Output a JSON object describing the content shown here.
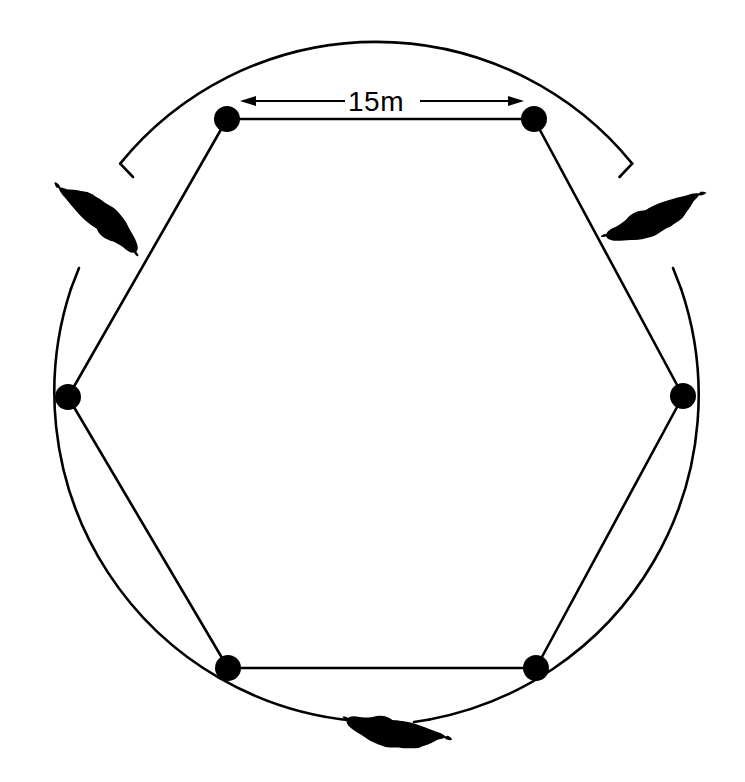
{
  "figure": {
    "background_color": "#ffffff",
    "ink_color": "#000000",
    "width": 745,
    "height": 782
  },
  "dimension": {
    "label": "15m",
    "value": 15,
    "unit": "m",
    "measures": "distance between adjacent hexagon vertices (top edge)",
    "line_y": 101,
    "left_arrow_x": 240,
    "right_arrow_x": 524,
    "label_x": 376,
    "label_y": 110
  },
  "circle": {
    "name": "outer-circle",
    "center_x": 376,
    "center_y": 393,
    "radius": 330,
    "stroke_width": 2.6,
    "stroke_color": "#000000",
    "fill": "none"
  },
  "hexagon": {
    "name": "inscribed-hexagon",
    "stroke_width": 2.6,
    "stroke_color": "#000000",
    "fill": "none",
    "vertex_count": 6,
    "side_length_label": "15m",
    "points": "227,119 534,119 683,396 536,668 228,668 68,397",
    "vertices": [
      {
        "id": "v1",
        "name": "vertex-top-left",
        "x": 227,
        "y": 119,
        "r": 13
      },
      {
        "id": "v2",
        "name": "vertex-top-right",
        "x": 534,
        "y": 119,
        "r": 13
      },
      {
        "id": "v3",
        "name": "vertex-right",
        "x": 683,
        "y": 396,
        "r": 13
      },
      {
        "id": "v4",
        "name": "vertex-bottom-right",
        "x": 536,
        "y": 668,
        "r": 13
      },
      {
        "id": "v5",
        "name": "vertex-bottom-left",
        "x": 228,
        "y": 668,
        "r": 13
      },
      {
        "id": "v6",
        "name": "vertex-left",
        "x": 68,
        "y": 397,
        "r": 13
      }
    ]
  },
  "blobs": [
    {
      "id": "b1",
      "name": "blob-upper-left",
      "description": "dark elongated organic silhouette on the circle, upper-left",
      "center_x": 100,
      "center_y": 216,
      "rotation_deg": -58,
      "length": 100,
      "width": 34
    },
    {
      "id": "b2",
      "name": "blob-upper-right",
      "description": "dark elongated organic silhouette on the circle, upper-right",
      "center_x": 655,
      "center_y": 219,
      "rotation_deg": 58,
      "length": 102,
      "width": 34
    },
    {
      "id": "b3",
      "name": "blob-bottom",
      "description": "dark elongated organic silhouette on the circle, bottom centre",
      "center_x": 396,
      "center_y": 733,
      "rotation_deg": 2,
      "length": 110,
      "width": 32
    }
  ],
  "circle_gaps": [
    {
      "name": "gap-upper-left",
      "start_deg": 186,
      "end_deg": 212
    },
    {
      "name": "gap-upper-right",
      "start_deg": 327,
      "end_deg": 353
    },
    {
      "name": "gap-bottom",
      "start_deg": 82,
      "end_deg": 99
    }
  ]
}
